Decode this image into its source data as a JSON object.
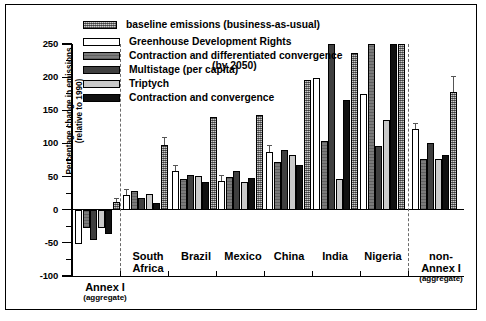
{
  "chart_data": {
    "type": "bar",
    "title": "",
    "xlabel": "",
    "ylabel": "Percentage change in emissions",
    "ylabel_sub": "(relative to 1990)",
    "ylim": [
      -100,
      250
    ],
    "yticks": [
      -100,
      -50,
      0,
      50,
      100,
      150,
      200,
      250
    ],
    "ytick_labels": [
      "-100",
      "-50",
      "0",
      "50",
      "100",
      "150",
      "200",
      "250"
    ],
    "yminor_step": 25,
    "grid": false,
    "legend_position": "top-left inside",
    "categories": [
      "Annex I",
      "South Africa",
      "Brazil",
      "Mexico",
      "China",
      "India",
      "Nigeria",
      "non-Annex I"
    ],
    "category_sublabels": [
      "(aggregate)",
      "",
      "",
      "",
      "",
      "",
      "",
      "(aggregate)"
    ],
    "series": [
      {
        "name": "Greenhouse Development Rights",
        "key": "gdr",
        "fill": "white",
        "values": [
          -52,
          22,
          58,
          44,
          87,
          198,
          175,
          122
        ],
        "err": [
          0,
          9,
          9,
          8,
          10,
          62,
          85,
          9
        ]
      },
      {
        "name": "Contraction and differentiated convergence",
        "key": "cdc",
        "fill": "medium-gray-hatch",
        "values": [
          -28,
          28,
          46,
          50,
          72,
          104,
          258,
          76
        ]
      },
      {
        "name": "Multistage (per capita)",
        "key": "multistage",
        "fill": "dark-gray",
        "values": [
          -45,
          17,
          53,
          58,
          90,
          260,
          96,
          100
        ]
      },
      {
        "name": "Triptych",
        "key": "triptych",
        "fill": "light-gray",
        "values": [
          -28,
          23,
          51,
          42,
          82,
          47,
          136,
          76
        ]
      },
      {
        "name": "Contraction and convergence (by 2050)",
        "key": "cc2050",
        "fill": "black",
        "values": [
          -37,
          10,
          42,
          48,
          68,
          165,
          258,
          82
        ]
      },
      {
        "name": "baseline emissions (business-as-usual)",
        "key": "baseline",
        "fill": "gray-crosshatch",
        "values": [
          11,
          98,
          140,
          143,
          196,
          236,
          260,
          177
        ],
        "err": [
          6,
          12,
          0,
          0,
          0,
          24,
          0,
          24
        ]
      }
    ]
  },
  "legend": {
    "entries": [
      {
        "label": "baseline emissions (business-as-usual)",
        "swatch": "baseline"
      },
      {
        "label": "Greenhouse Development Rights",
        "swatch": "gdr"
      },
      {
        "label": "Contraction and differentiated convergence",
        "swatch": "cdc"
      },
      {
        "label": "Multistage (per capita)",
        "swatch": "multistage"
      },
      {
        "label": "Triptych",
        "swatch": "triptych"
      },
      {
        "label": "Contraction and convergence",
        "swatch": "cc2050"
      }
    ],
    "cc_second_line": "(by 2050)"
  },
  "axis": {
    "y_title_line1": "Percentage change in emissions",
    "y_title_line2": "(relative to 1990)",
    "ticks": {
      "t250": "250",
      "t200": "200",
      "t150": "150",
      "t100": "100",
      "t50": "50",
      "t0": "0",
      "tm50": "-50",
      "tm100": "-100"
    }
  },
  "groups": [
    {
      "name": "Annex I",
      "sub": "(aggregate)"
    },
    {
      "name": "South",
      "sub": "Africa"
    },
    {
      "name": "Brazil",
      "sub": ""
    },
    {
      "name": "Mexico",
      "sub": ""
    },
    {
      "name": "China",
      "sub": ""
    },
    {
      "name": "India",
      "sub": ""
    },
    {
      "name": "Nigeria",
      "sub": ""
    },
    {
      "name": "non-",
      "sub": "Annex I",
      "sub2": "(aggregate)"
    }
  ],
  "colors": {
    "baseline": "#8e8e8e",
    "gdr": "#ffffff",
    "cdc": "#7b7b7b",
    "multistage": "#3f3f3f",
    "triptych": "#c9c9c9",
    "cc2050": "#111111",
    "axis": "#000000",
    "separator": "#6a6a6a"
  }
}
